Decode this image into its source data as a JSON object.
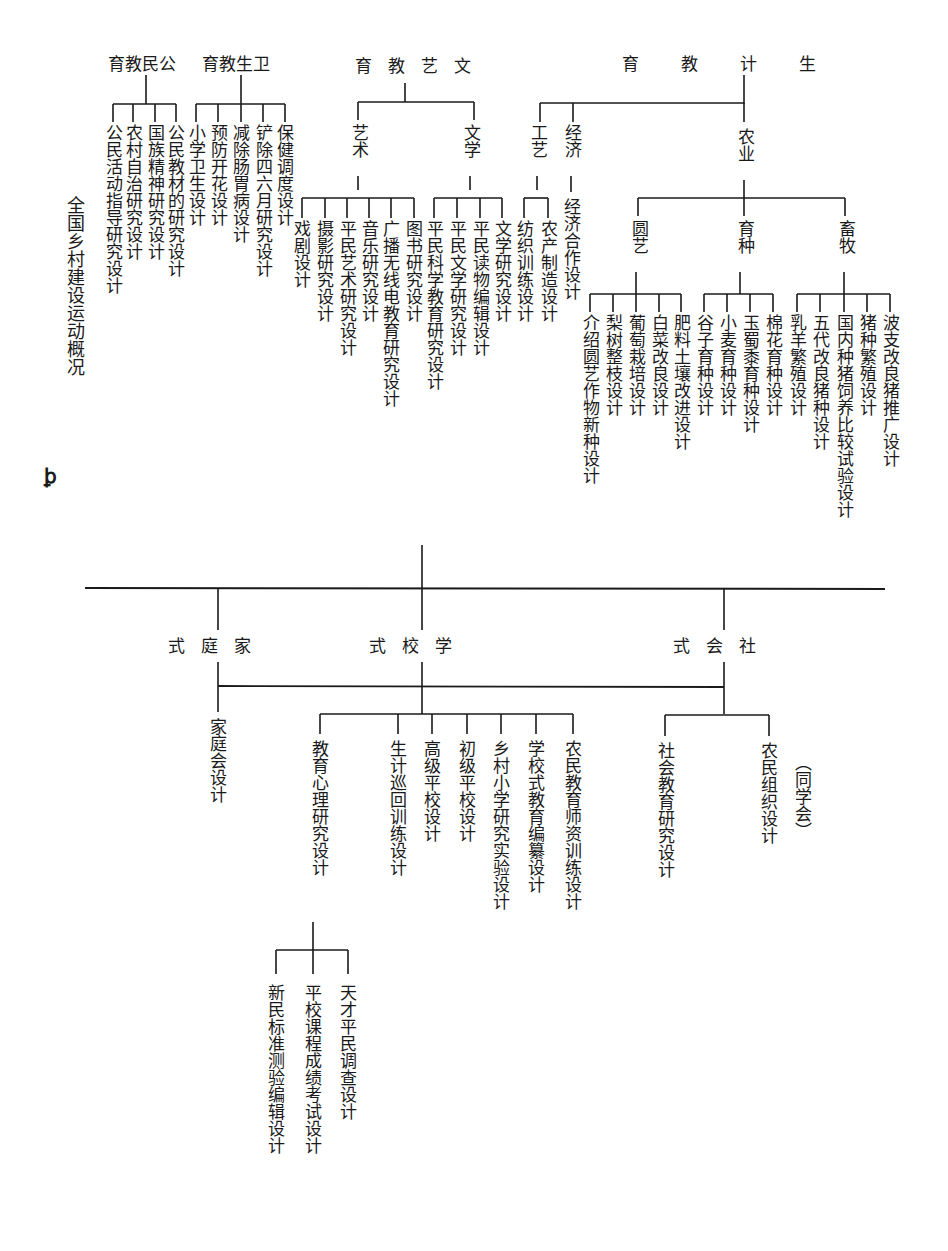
{
  "diagram": {
    "side_title": "全国乡村建设运动概况",
    "top_groups": [
      {
        "label": "育教民公",
        "children": [
          "公民活动指导研究设计",
          "农村自治研究设计",
          "国族精神研究设计",
          "公民教材的研究设计"
        ]
      },
      {
        "label": "育教生卫",
        "children": [
          "小学卫生设计",
          "预防开花设计",
          "减除肠胃病设计",
          "铲除四六月研究设计",
          "保健调度设计"
        ]
      },
      {
        "label": "育教艺文",
        "subgroups": [
          {
            "label": "艺术",
            "children": [
              "戏剧设计",
              "摄影研究设计",
              "平民艺术研究设计",
              "音乐研究设计",
              "广播无线电教育研究设计",
              "图书研究设计"
            ]
          },
          {
            "label": "文学",
            "children": [
              "平民科学教育研究设计",
              "平民文学研究设计",
              "平民读物编辑设计",
              "文学研究设计"
            ]
          }
        ]
      },
      {
        "label": "育教计生",
        "subgroups": [
          {
            "label": "工艺",
            "children": [
              "纺织训练设计",
              "农产制造设计"
            ]
          },
          {
            "label": "经济",
            "children": [
              "经济合作设计"
            ]
          },
          {
            "label": "农业",
            "subgroups": [
              {
                "label": "圆艺",
                "children": [
                  "介绍圆艺作物新种设计",
                  "梨树整枝设计",
                  "葡萄栽培设计",
                  "白菜改良设计",
                  "肥料土壤改进设计"
                ]
              },
              {
                "label": "育种",
                "children": [
                  "谷子育种设计",
                  "小麦育种设计",
                  "玉蜀黍育种设计",
                  "棉花育种设计"
                ]
              },
              {
                "label": "畜牧",
                "children": [
                  "乳羊繁殖设计",
                  "五代改良猪种设计",
                  "国内种猪饲养比较试验设计",
                  "猪种繁殖设计",
                  "波支改良猪推广设计"
                ]
              }
            ]
          }
        ]
      }
    ],
    "margin_mark": "ꝧ",
    "bottom_groups": [
      {
        "label": "式庭家",
        "children": [
          "家庭会设计"
        ]
      },
      {
        "label": "式校学",
        "children": [
          {
            "label": "教育心理研究设计",
            "children": [
              "新民标准测验编辑设计",
              "平校课程成绩考试设计",
              "天才平民调查设计"
            ]
          },
          {
            "label": "生计巡回训练设计"
          },
          {
            "label": "高级平校设计"
          },
          {
            "label": "初级平校设计"
          },
          {
            "label": "乡村小学研究实验设计"
          },
          {
            "label": "学校式教育编纂设计"
          },
          {
            "label": "农民教育师资训练设计"
          }
        ]
      },
      {
        "label": "式会社",
        "children": [
          "社会教育研究设计",
          "农民组织设计"
        ],
        "note": "（同学会）"
      }
    ]
  },
  "colors": {
    "ink": "#1a1a1a",
    "paper": "#ffffff"
  }
}
